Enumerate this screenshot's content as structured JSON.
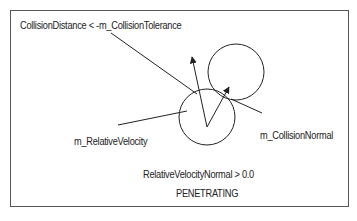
{
  "diagram": {
    "labels": {
      "collision_distance": "CollisionDistance < -m_CollisionTolerance",
      "collision_normal": "m_CollisionNormal",
      "relative_velocity": "m_RelativeVelocity",
      "relative_velocity_normal": "RelativeVelocityNormal > 0.0",
      "state": "PENETRATING"
    },
    "colors": {
      "stroke": "#222222",
      "border": "#555555",
      "background": "#ffffff"
    }
  }
}
